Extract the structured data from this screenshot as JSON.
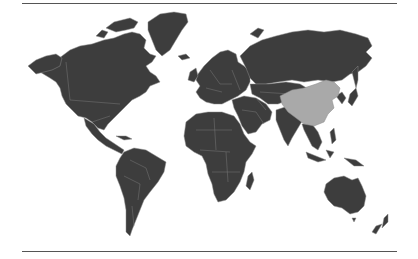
{
  "figure": {
    "type": "choropleth-world-map",
    "highlighted_country": "China",
    "colors": {
      "background": "#ffffff",
      "default_country": "#3d3d3d",
      "highlighted_country": "#a9a9a9",
      "country_borders": "#8a8a8a",
      "rules": "#555555"
    },
    "rules": [
      "top",
      "bottom"
    ]
  }
}
